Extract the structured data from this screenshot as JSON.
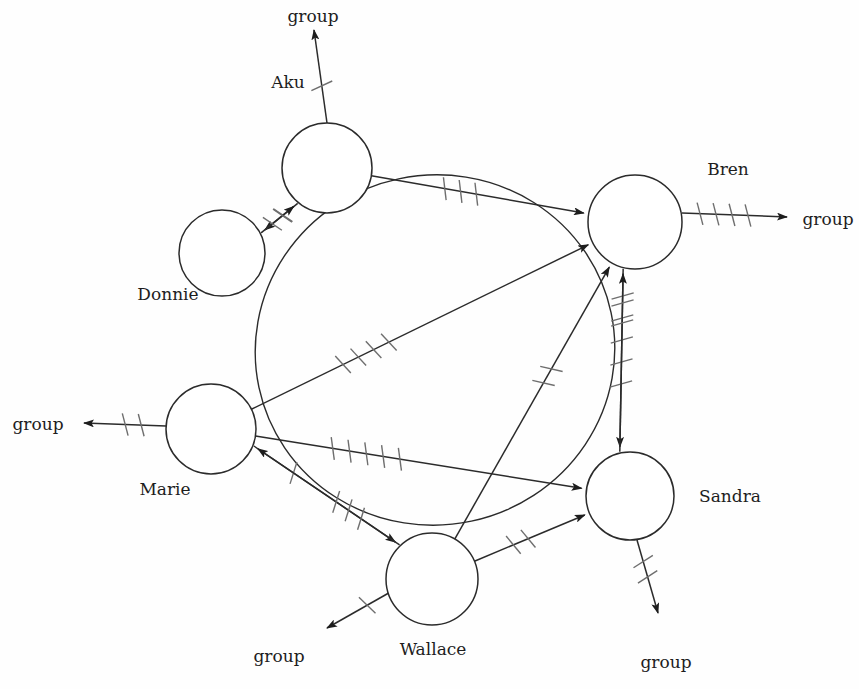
{
  "diagram": {
    "type": "sociogram",
    "title": "",
    "canvas": {
      "width": 859,
      "height": 689
    },
    "group_boundary": {
      "shape": "ellipse",
      "label": "group",
      "cx": 435,
      "cy": 350,
      "rx": 180,
      "ry": 175,
      "rotation": -12
    },
    "nodes": [
      {
        "id": "aku",
        "label": "Aku",
        "cx": 327,
        "cy": 168,
        "r": 45,
        "label_x": 288,
        "label_y": 88,
        "label_anchor": "middle",
        "in_group": true
      },
      {
        "id": "donnie",
        "label": "Donnie",
        "cx": 222,
        "cy": 253,
        "r": 43,
        "label_x": 168,
        "label_y": 300,
        "label_anchor": "middle",
        "in_group": false
      },
      {
        "id": "bren",
        "label": "Bren",
        "cx": 635,
        "cy": 222,
        "r": 47,
        "label_x": 728,
        "label_y": 175,
        "label_anchor": "middle",
        "in_group": true
      },
      {
        "id": "sandra",
        "label": "Sandra",
        "cx": 630,
        "cy": 496,
        "r": 44,
        "label_x": 730,
        "label_y": 502,
        "label_anchor": "middle",
        "in_group": true
      },
      {
        "id": "wallace",
        "label": "Wallace",
        "cx": 432,
        "cy": 579,
        "r": 46,
        "label_x": 433,
        "label_y": 655,
        "label_anchor": "middle",
        "in_group": true
      },
      {
        "id": "marie",
        "label": "Marie",
        "cx": 211,
        "cy": 429,
        "r": 45,
        "label_x": 165,
        "label_y": 495,
        "label_anchor": "middle",
        "in_group": true
      }
    ],
    "internal_edges": [
      {
        "id": "aku-donnie",
        "from": "aku",
        "to": "donnie",
        "ticks": 1,
        "curve": 0,
        "label": "Aku to Donnie"
      },
      {
        "id": "donnie-aku",
        "from": "donnie",
        "to": "aku",
        "ticks": 2,
        "curve": 0,
        "label": "Donnie to Aku"
      },
      {
        "id": "aku-bren",
        "from": "aku",
        "to": "bren",
        "ticks": 3,
        "curve": 0,
        "label": "Aku to Bren"
      },
      {
        "id": "marie-bren",
        "from": "marie",
        "to": "bren",
        "ticks": 4,
        "curve": 0,
        "label": "Marie to Bren"
      },
      {
        "id": "marie-sandra",
        "from": "marie",
        "to": "sandra",
        "ticks": 5,
        "curve": 0,
        "label": "Marie to Sandra"
      },
      {
        "id": "marie-wallace",
        "from": "marie",
        "to": "wallace",
        "ticks": 1,
        "curve": 0,
        "label": "Marie to Wallace"
      },
      {
        "id": "wallace-marie",
        "from": "wallace",
        "to": "marie",
        "ticks": 3,
        "curve": 0,
        "label": "Wallace to Marie"
      },
      {
        "id": "wallace-bren",
        "from": "wallace",
        "to": "bren",
        "ticks": 2,
        "curve": 0,
        "label": "Wallace to Bren"
      },
      {
        "id": "wallace-sandra",
        "from": "wallace",
        "to": "sandra",
        "ticks": 2,
        "curve": 0,
        "label": "Wallace to Sandra"
      },
      {
        "id": "bren-sandra",
        "from": "bren",
        "to": "sandra",
        "ticks": 5,
        "curve": 0,
        "label": "Bren to Sandra"
      },
      {
        "id": "sandra-bren",
        "from": "sandra",
        "to": "bren",
        "ticks": 2,
        "curve": 0,
        "label": "Sandra to Bren"
      }
    ],
    "group_edges": [
      {
        "id": "aku-group",
        "from": "aku",
        "label": "group",
        "ticks": 1,
        "x1": 327,
        "y1": 123,
        "x2": 314,
        "y2": 30,
        "label_x": 313,
        "label_y": 22,
        "label_anchor": "middle"
      },
      {
        "id": "bren-group",
        "from": "bren",
        "label": "group",
        "ticks": 4,
        "x1": 682,
        "y1": 213,
        "x2": 787,
        "y2": 217,
        "label_x": 828,
        "label_y": 225,
        "label_anchor": "middle"
      },
      {
        "id": "sandra-group",
        "from": "sandra",
        "label": "group",
        "ticks": 2,
        "x1": 637,
        "y1": 540,
        "x2": 658,
        "y2": 613,
        "label_x": 666,
        "label_y": 668,
        "label_anchor": "middle"
      },
      {
        "id": "wallace-group",
        "from": "wallace",
        "label": "group",
        "ticks": 1,
        "x1": 394,
        "y1": 590,
        "x2": 327,
        "y2": 628,
        "label_x": 279,
        "label_y": 662,
        "label_anchor": "middle"
      },
      {
        "id": "marie-group",
        "from": "marie",
        "label": "group",
        "ticks": 2,
        "x1": 166,
        "y1": 426,
        "x2": 84,
        "y2": 423,
        "label_x": 38,
        "label_y": 430,
        "label_anchor": "middle"
      }
    ],
    "legend": {
      "tick_meaning": "number of interactions",
      "arrow_meaning": "direction of communication"
    }
  }
}
